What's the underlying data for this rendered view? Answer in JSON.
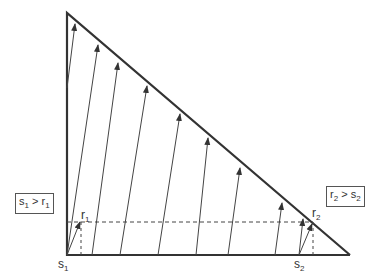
{
  "diagram": {
    "triangle": {
      "apex": [
        67,
        13
      ],
      "origin": [
        67,
        255
      ],
      "end": [
        350,
        255
      ],
      "stroke": "#333333"
    },
    "arrows": [
      {
        "from": [
          67,
          88
        ],
        "to": [
          75,
          24
        ]
      },
      {
        "from": [
          67,
          255
        ],
        "to": [
          98,
          45
        ]
      },
      {
        "from": [
          92,
          255
        ],
        "to": [
          118,
          63
        ]
      },
      {
        "from": [
          120,
          255
        ],
        "to": [
          147,
          86
        ]
      },
      {
        "from": [
          158,
          255
        ],
        "to": [
          180,
          114
        ]
      },
      {
        "from": [
          196,
          255
        ],
        "to": [
          208,
          138
        ]
      },
      {
        "from": [
          228,
          255
        ],
        "to": [
          240,
          168
        ]
      },
      {
        "from": [
          275,
          255
        ],
        "to": [
          282,
          203
        ]
      },
      {
        "from": [
          299,
          255
        ],
        "to": [
          303,
          219
        ]
      },
      {
        "from": [
          299,
          255
        ],
        "to": [
          312,
          224
        ]
      },
      {
        "from": [
          67,
          255
        ],
        "to": [
          80,
          222
        ]
      }
    ],
    "dashed_horizontal": {
      "x1": 67,
      "x2": 313,
      "y": 222
    },
    "dashed_verticals": [
      {
        "x": 81,
        "y1": 222,
        "y2": 255
      },
      {
        "x": 313,
        "y1": 222,
        "y2": 255
      }
    ],
    "labels": {
      "r1": {
        "main": "r",
        "sub": "1"
      },
      "r2": {
        "main": "r",
        "sub": "2"
      },
      "s1": {
        "main": "s",
        "sub": "1"
      },
      "s2": {
        "main": "s",
        "sub": "2"
      }
    },
    "boxes": {
      "left": {
        "a": "s",
        "a_sub": "1",
        "op": " > ",
        "b": "r",
        "b_sub": "1"
      },
      "right": {
        "a": "r",
        "a_sub": "2",
        "op": " > ",
        "b": "s",
        "b_sub": "2"
      }
    }
  }
}
